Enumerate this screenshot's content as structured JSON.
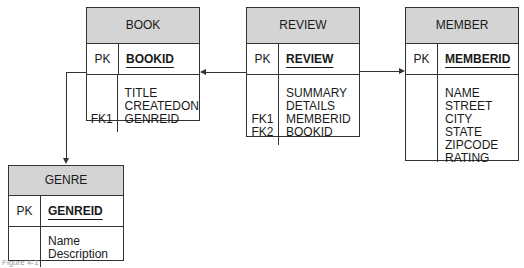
{
  "entities": {
    "book": {
      "name": "BOOK",
      "pk_label": "PK",
      "pk_field": "BOOKID",
      "fk_labels": [
        "",
        "",
        "FK1"
      ],
      "fields": [
        "TITLE",
        "CREATEDON",
        "GENREID"
      ]
    },
    "review": {
      "name": "REVIEW",
      "pk_label": "PK",
      "pk_field": "REVIEW",
      "fk_labels": [
        "",
        "",
        "FK1",
        "FK2"
      ],
      "fields": [
        "SUMMARY",
        "DETAILS",
        "MEMBERID",
        "BOOKID"
      ]
    },
    "member": {
      "name": "MEMBER",
      "pk_label": "PK",
      "pk_field": "MEMBERID",
      "fk_labels": [],
      "fields": [
        "NAME",
        "STREET",
        "CITY",
        "STATE",
        "ZIPCODE",
        "RATING"
      ]
    },
    "genre": {
      "name": "GENRE",
      "pk_label": "PK",
      "pk_field": "GENREID",
      "fk_labels": [],
      "fields": [
        "Name",
        "Description"
      ]
    }
  },
  "relationships": [
    {
      "from": "REVIEW",
      "to": "BOOK"
    },
    {
      "from": "REVIEW",
      "to": "MEMBER"
    },
    {
      "from": "BOOK",
      "to": "GENRE"
    }
  ],
  "colors": {
    "header_fill": "#d4d4d4",
    "line": "#333333"
  },
  "caption": "Figure 4-1"
}
